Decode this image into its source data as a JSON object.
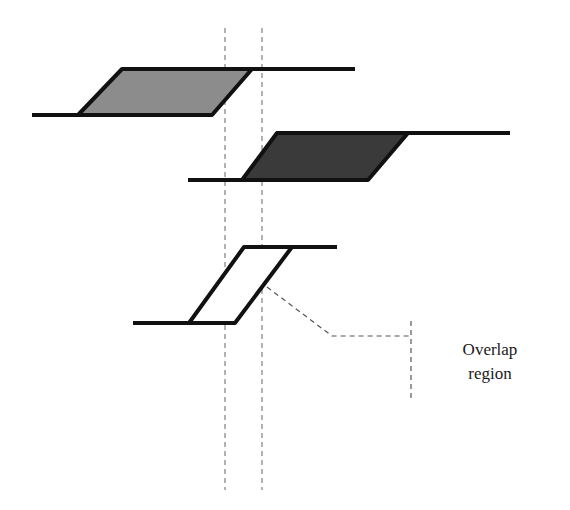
{
  "diagram": {
    "title": "",
    "annotation": {
      "line1": "Overlap",
      "line2": "region"
    },
    "colors": {
      "stroke": "#111111",
      "fill_top": "#8c8c8c",
      "fill_middle": "#3a3a3a",
      "fill_bottom": "#ffffff",
      "dashed": "#555555"
    },
    "shapes": [
      {
        "name": "top-pulse",
        "fill": "mid-gray",
        "baseline_start": [
          32,
          115
        ],
        "bottom_left": [
          78,
          115
        ],
        "top_left": [
          122,
          69
        ],
        "top_right": [
          252,
          69
        ],
        "bottom_right": [
          212,
          115
        ],
        "top_line_end": [
          355,
          69
        ]
      },
      {
        "name": "middle-pulse",
        "fill": "dark-gray",
        "baseline_start": [
          188,
          180
        ],
        "bottom_left": [
          242,
          180
        ],
        "top_left": [
          277,
          133
        ],
        "top_right": [
          408,
          133
        ],
        "bottom_right": [
          368,
          180
        ],
        "top_line_end": [
          510,
          133
        ]
      },
      {
        "name": "overlap-pulse",
        "fill": "white",
        "baseline_start": [
          133,
          323
        ],
        "bottom_left": [
          189,
          323
        ],
        "top_left": [
          244,
          247
        ],
        "top_right": [
          292,
          247
        ],
        "bottom_right": [
          235,
          323
        ],
        "top_line_end": [
          337,
          247
        ]
      }
    ],
    "guides": [
      {
        "name": "left-boundary",
        "x": 225,
        "y1": 28,
        "y2": 490
      },
      {
        "name": "right-boundary",
        "x": 262,
        "y1": 28,
        "y2": 490
      }
    ],
    "leader": {
      "points": [
        [
          267,
          287
        ],
        [
          332,
          336
        ],
        [
          411,
          336
        ]
      ],
      "bracket": {
        "x": 411,
        "y1": 321,
        "y2": 398
      }
    }
  }
}
